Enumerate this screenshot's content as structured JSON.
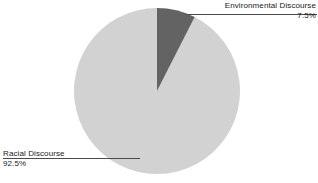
{
  "chart_data": {
    "type": "pie",
    "title": "",
    "categories": [
      "Racial Discourse",
      "Environmental Discourse"
    ],
    "values": [
      92.5,
      7.5
    ],
    "value_labels": [
      "92.5%",
      "7.5%"
    ],
    "unit": "%",
    "total": 100,
    "start_angle_deg": 0,
    "direction": "clockwise",
    "legend": "none",
    "labels_position": "callout",
    "grid": false,
    "slices": [
      {
        "name": "Racial Discourse",
        "value": 92.5,
        "value_label": "92.5%",
        "color": "#d2d2d2",
        "start_deg": 27,
        "sweep_deg": 333,
        "callout_position": "bottom-left"
      },
      {
        "name": "Environmental Discourse",
        "value": 7.5,
        "value_label": "7.5%",
        "color": "#636363",
        "start_deg": 0,
        "sweep_deg": 27,
        "callout_position": "top-right"
      }
    ]
  },
  "callouts": {
    "environmental": {
      "name": "Environmental Discourse",
      "value": "7.5%"
    },
    "racial": {
      "name": "Racial Discourse",
      "value": "92.5%"
    }
  },
  "colors": {
    "background": "#ffffff",
    "slice_major": "#d2d2d2",
    "slice_minor": "#636363",
    "text": "#1a1a1a",
    "leader_line": "#4a4a4a"
  },
  "geometry": {
    "center_x": 157,
    "center_y": 91,
    "radius": 83
  }
}
